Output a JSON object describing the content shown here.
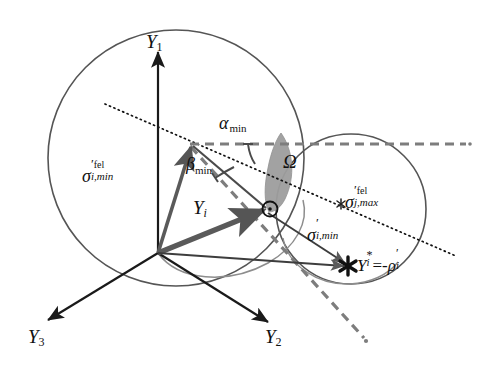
{
  "figure": {
    "background_color": "#ffffff",
    "colors": {
      "axis_black": "#1a1a1a",
      "circle_gray": "#555555",
      "vector_gray": "#5a5a5a",
      "dashed_gray": "#7d7d7d",
      "lens_fill": "#9e9e9e",
      "dotted_black": "#111111"
    },
    "axes": [
      {
        "name": "Y1",
        "label": "Y",
        "sub": "1",
        "x": 146,
        "y": 42
      },
      {
        "name": "Y2",
        "label": "Y",
        "sub": "2",
        "x": 271,
        "y": 340
      },
      {
        "name": "Y3",
        "label": "Y",
        "sub": "3",
        "x": 35,
        "y": 340
      }
    ],
    "labels": {
      "sigma_i_min_fel": {
        "symbol": "σ",
        "prime": "′",
        "superscript": "fel",
        "subscript": "i,min",
        "x": 86,
        "y": 172
      },
      "sigma_j_max_fel": {
        "symbol": "σ",
        "prime": "′",
        "superscript": "fel",
        "subscript": "j,max",
        "x": 349,
        "y": 197
      },
      "sigma_i_min_prime": {
        "symbol": "σ",
        "prime": "′",
        "subscript": "i,min",
        "x": 311,
        "y": 228
      },
      "alpha_min": {
        "symbol": "α",
        "subscript": "min",
        "x": 223,
        "y": 122
      },
      "beta_min": {
        "symbol": "β",
        "subscript": "min",
        "x": 189,
        "y": 164
      },
      "omega": {
        "symbol": "Ω",
        "x": 286,
        "y": 162
      },
      "y_i_vector": {
        "symbol": "Y",
        "subscript": "i",
        "x": 196,
        "y": 207
      },
      "y_i_star": {
        "text_parts": {
          "y": "Y",
          "star": "*",
          "sub_i": "i",
          "equals": "=",
          "minus": "-",
          "rho": "ρ",
          "rho_prime": "′",
          "rho_sub": "i"
        },
        "x": 359,
        "y": 258
      }
    },
    "markers": {
      "intersection_point": {
        "name": "circle-marker",
        "x": 266,
        "y": 208,
        "glyph": "⊙"
      },
      "y_star_point": {
        "name": "asterisk-marker",
        "x": 348,
        "y": 266,
        "glyph": "✻"
      },
      "sigma_j_max_point": {
        "name": "small-star-marker",
        "x": 341,
        "y": 204,
        "glyph": "✳"
      }
    },
    "geometry": {
      "origin": {
        "x": 158,
        "y": 253
      },
      "big_circle": {
        "cx": 176,
        "cy": 158,
        "r": 128
      },
      "small_circle": {
        "cx": 351,
        "cy": 209,
        "r": 75
      },
      "dashed_horizontal": {
        "x1": 190,
        "y1": 144,
        "x2": 466,
        "y2": 144
      },
      "dotted_line": {
        "x1": 105,
        "y1": 104,
        "x2": 456,
        "y2": 256
      },
      "vector_tip_upper": {
        "x": 192,
        "y": 140
      },
      "lens": {
        "cx": 277,
        "cy": 175
      }
    }
  }
}
